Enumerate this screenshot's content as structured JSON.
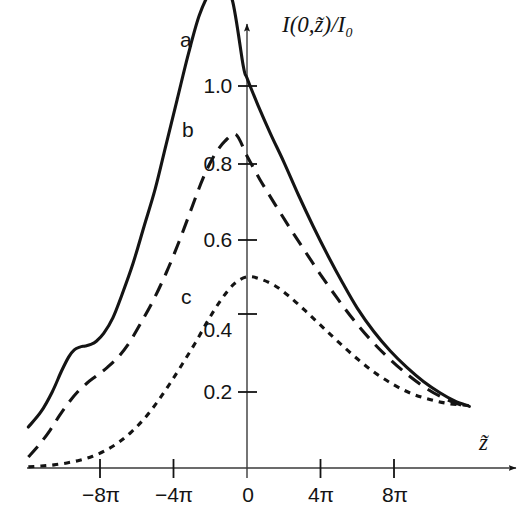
{
  "figure": {
    "background_color": "#ffffff",
    "ink_color": "#141414"
  },
  "axes": {
    "y_axis_title": "I(0,z̃)/I₀",
    "x_axis_title": "z̃",
    "y_ticks": [
      {
        "label": "0.2",
        "value": 0.2
      },
      {
        "label": "0.4",
        "value": 0.4
      },
      {
        "label": "0.6",
        "value": 0.6
      },
      {
        "label": "0.8",
        "value": 0.8
      },
      {
        "label": "1.0",
        "value": 1.0
      }
    ],
    "x_ticks": [
      {
        "label": "−8π",
        "value": -8
      },
      {
        "label": "−4π",
        "value": -4
      },
      {
        "label": "0",
        "value": 0
      },
      {
        "label": "4π",
        "value": 4
      },
      {
        "label": "8π",
        "value": 8
      }
    ]
  },
  "curve_labels": {
    "a": "a",
    "b": "b",
    "c": "c"
  },
  "chart_data": {
    "type": "line",
    "title": "",
    "xlabel": "z̃",
    "ylabel": "I(0,z̃)/I₀",
    "xlim": [
      -11.8,
      12.2
    ],
    "ylim": [
      0,
      1.35
    ],
    "x_unit": "pi",
    "grid": false,
    "legend": "inline-curve-labels",
    "x_tick_values": [
      -8,
      -4,
      0,
      4,
      8
    ],
    "x_tick_labels": [
      "−8π",
      "−4π",
      "0",
      "4π",
      "8π"
    ],
    "y_tick_values": [
      0.2,
      0.4,
      0.6,
      0.8,
      1.0
    ],
    "y_tick_labels": [
      "0.2",
      "0.4",
      "0.6",
      "0.8",
      "1.0"
    ],
    "series": [
      {
        "name": "a",
        "label": "a",
        "linestyle": "solid",
        "peak_x": -2.3,
        "peak_y": 1.23,
        "value_at_zero": 1.0,
        "x": [
          -11.9,
          -11.2,
          -10.6,
          -10.1,
          -9.7,
          -9.4,
          -9.1,
          -8.8,
          -8.5,
          -8.2,
          -7.8,
          -7.3,
          -6.8,
          -6.2,
          -5.6,
          -5.0,
          -4.4,
          -3.8,
          -3.2,
          -2.6,
          -2.0,
          -1.4,
          -0.8,
          -0.2,
          0.0,
          0.6,
          1.3,
          2.0,
          2.8,
          3.6,
          4.4,
          5.2,
          6.0,
          6.9,
          7.8,
          8.7,
          9.6,
          10.5,
          11.3,
          12.1
        ],
        "y": [
          0.105,
          0.145,
          0.195,
          0.248,
          0.285,
          0.303,
          0.31,
          0.313,
          0.317,
          0.325,
          0.345,
          0.385,
          0.445,
          0.525,
          0.62,
          0.715,
          0.83,
          0.945,
          1.06,
          1.16,
          1.22,
          1.235,
          1.2,
          1.03,
          1.0,
          0.93,
          0.855,
          0.785,
          0.7,
          0.62,
          0.545,
          0.475,
          0.41,
          0.35,
          0.3,
          0.258,
          0.222,
          0.193,
          0.172,
          0.158
        ]
      },
      {
        "name": "b",
        "label": "b",
        "linestyle": "dashed",
        "peak_x": -2.3,
        "peak_y": 0.855,
        "value_at_zero": 0.8,
        "x": [
          -11.9,
          -11.3,
          -10.7,
          -10.2,
          -9.7,
          -9.2,
          -8.7,
          -8.2,
          -7.6,
          -7.0,
          -6.4,
          -5.8,
          -5.1,
          -4.4,
          -3.7,
          -3.0,
          -2.4,
          -1.8,
          -1.2,
          -0.6,
          0.0,
          0.7,
          1.5,
          2.3,
          3.1,
          4.0,
          4.9,
          5.8,
          6.8,
          7.8,
          8.8,
          9.8,
          10.8,
          11.7,
          12.1
        ],
        "y": [
          0.028,
          0.06,
          0.098,
          0.135,
          0.168,
          0.196,
          0.218,
          0.236,
          0.258,
          0.285,
          0.322,
          0.37,
          0.43,
          0.5,
          0.58,
          0.668,
          0.742,
          0.8,
          0.838,
          0.855,
          0.8,
          0.74,
          0.678,
          0.618,
          0.56,
          0.496,
          0.436,
          0.38,
          0.325,
          0.278,
          0.237,
          0.203,
          0.177,
          0.161,
          0.157
        ]
      },
      {
        "name": "c",
        "label": "c",
        "linestyle": "dotted",
        "peak_x": -0.1,
        "peak_y": 0.49,
        "value_at_zero": 0.49,
        "x": [
          -11.9,
          -11.2,
          -10.5,
          -9.8,
          -9.1,
          -8.4,
          -7.7,
          -7.0,
          -6.3,
          -5.6,
          -4.9,
          -4.2,
          -3.5,
          -2.8,
          -2.1,
          -1.4,
          -0.7,
          0.0,
          0.7,
          1.5,
          2.3,
          3.2,
          4.1,
          5.0,
          6.0,
          7.0,
          8.0,
          9.0,
          10.0,
          11.0,
          12.1
        ],
        "y": [
          0.003,
          0.005,
          0.008,
          0.013,
          0.02,
          0.03,
          0.045,
          0.065,
          0.092,
          0.126,
          0.168,
          0.216,
          0.268,
          0.322,
          0.38,
          0.432,
          0.472,
          0.49,
          0.485,
          0.468,
          0.44,
          0.402,
          0.362,
          0.322,
          0.28,
          0.243,
          0.213,
          0.19,
          0.175,
          0.165,
          0.16
        ]
      }
    ]
  }
}
